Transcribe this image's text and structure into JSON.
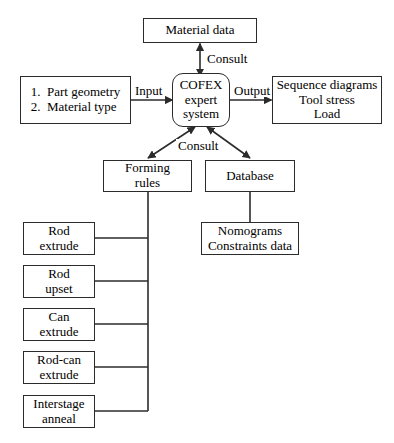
{
  "diagram": {
    "background_color": "#ffffff",
    "line_color": "#2b2b2b",
    "text_color": "#000000",
    "nodes": {
      "material_data": {
        "label": "Material data"
      },
      "part_inputs": {
        "label": "1.  Part geometry\n2.  Material type"
      },
      "cofex": {
        "label": "COFEX\nexpert\nsystem"
      },
      "outputs": {
        "label": "Sequence diagrams\nTool stress\nLoad"
      },
      "forming_rules": {
        "label": "Forming\nrules"
      },
      "database": {
        "label": "Database"
      },
      "nomograms": {
        "label": "Nomograms\nConstraints data"
      },
      "rod_extrude": {
        "label": "Rod\nextrude"
      },
      "rod_upset": {
        "label": "Rod\nupset"
      },
      "can_extrude": {
        "label": "Can\nextrude"
      },
      "rod_can_extrude": {
        "label": "Rod-can\nextrude"
      },
      "interstage_anneal": {
        "label": "Interstage\nanneal"
      }
    },
    "edge_labels": {
      "consult_top": "Consult",
      "input": "Input",
      "output": "Output",
      "consult_bottom": "Consult"
    }
  }
}
